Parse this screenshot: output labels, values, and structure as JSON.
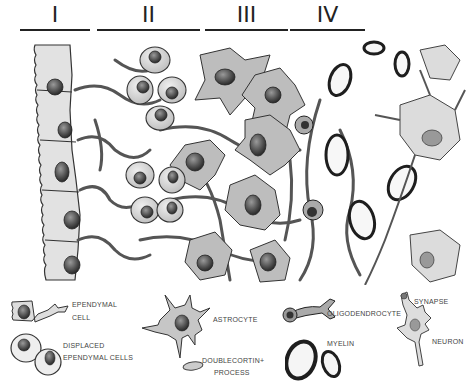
{
  "diagram": {
    "layers": [
      {
        "label": "I",
        "x": 20,
        "w": 70
      },
      {
        "label": "II",
        "x": 97,
        "w": 103
      },
      {
        "label": "III",
        "x": 205,
        "w": 83
      },
      {
        "label": "IV",
        "x": 290,
        "w": 75
      }
    ],
    "legend": {
      "ependymal_cell": {
        "line1": "EPENDYMAL",
        "line2": "CELL"
      },
      "displaced_ependymal": {
        "line1": "DISPLACED",
        "line2": "EPENDYMAL CELLS"
      },
      "astrocyte": {
        "label": "ASTROCYTE"
      },
      "doublecortin": {
        "line1": "DOUBLECORTIN+",
        "line2": "PROCESS"
      },
      "oligodendrocyte": {
        "label": "OLIGODENDROCYTE"
      },
      "myelin": {
        "label": "MYELIN"
      },
      "synapse": {
        "label": "SYNAPSE"
      },
      "neuron": {
        "label": "NEURON"
      }
    },
    "colors": {
      "ink": "#222222",
      "cell_fill": "#c9c9c9",
      "cell_light": "#e4e4e4",
      "nucleus": "#555555",
      "background": "#ffffff"
    }
  }
}
